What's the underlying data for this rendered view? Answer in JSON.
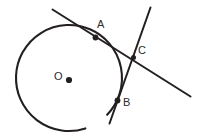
{
  "figure": {
    "width": 202,
    "height": 139,
    "background_color": "#ffffff",
    "stroke_color": "#231f20",
    "label_color": "#2b2b2b"
  },
  "labels": {
    "point_a": "A",
    "point_b": "B",
    "point_c": "C",
    "center_o": "O"
  },
  "geometry": {
    "circle": {
      "center_x": 69,
      "center_y": 78,
      "radius": 53,
      "stroke_width": 2.1,
      "arc_gap_description": "open arc, gap at lower-right-bottom",
      "arc_start_deg": 72,
      "arc_end_deg": 404
    },
    "center_dot": {
      "x": 69,
      "y": 80,
      "r": 3.1
    },
    "points": [
      {
        "name": "A",
        "x": 95.5,
        "y": 37.5,
        "r": 2.9
      },
      {
        "name": "B",
        "x": 117.5,
        "y": 100.5,
        "r": 2.9
      },
      {
        "name": "C",
        "x": 133.5,
        "y": 57.5,
        "r": 2.5
      }
    ],
    "lines": [
      {
        "name": "secant-line",
        "x1": 52.5,
        "y1": 9.5,
        "x2": 190.5,
        "y2": 96.5,
        "stroke_width": 2.0
      },
      {
        "name": "steep-line",
        "x1": 150.5,
        "y1": 7.5,
        "x2": 109.5,
        "y2": 123.5,
        "stroke_width": 2.0
      }
    ]
  }
}
